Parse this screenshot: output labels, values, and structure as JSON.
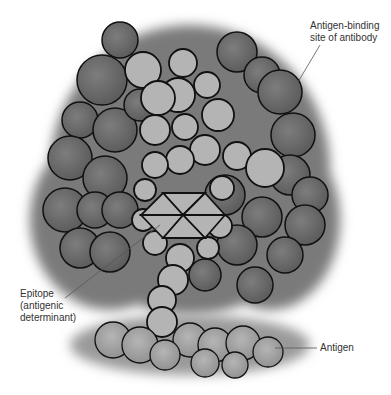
{
  "figure": {
    "colors": {
      "antibody_dark": "#6e6e6e",
      "antibody_light": "#b4b4b4",
      "antigen": "#a8a8a8",
      "outline": "#111111",
      "leader_line": "#555555",
      "label_text": "#333333"
    }
  },
  "labels": {
    "binding_site": {
      "line1": "Antigen-binding",
      "line2": "site of antibody"
    },
    "epitope": {
      "line1": "Epitope",
      "line2": "(antigenic",
      "line3": "determinant)"
    },
    "antigen": {
      "line1": "Antigen"
    }
  }
}
